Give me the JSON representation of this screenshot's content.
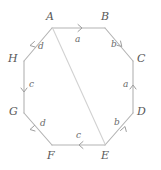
{
  "figure": {
    "name": "labeled-octagon-with-diagonal",
    "shape": "octagon",
    "stroke_color": "#b3b3b3",
    "diagonal_color": "#d0d0d0",
    "label_color": "#585858",
    "edge_label_color": "#6a6a6a",
    "background": "#ffffff"
  },
  "vertices": [
    {
      "id": "A",
      "label": "A",
      "x": 52,
      "y": 28,
      "label_x": 46,
      "label_y": 11
    },
    {
      "id": "B",
      "label": "B",
      "x": 105,
      "y": 28,
      "label_x": 101,
      "label_y": 11
    },
    {
      "id": "C",
      "label": "C",
      "x": 133,
      "y": 61,
      "label_x": 137,
      "label_y": 52
    },
    {
      "id": "D",
      "label": "D",
      "x": 133,
      "y": 113,
      "label_x": 137,
      "label_y": 105
    },
    {
      "id": "E",
      "label": "E",
      "x": 105,
      "y": 145,
      "label_x": 101,
      "label_y": 150
    },
    {
      "id": "F",
      "label": "F",
      "x": 52,
      "y": 145,
      "label_x": 47,
      "label_y": 150
    },
    {
      "id": "G",
      "label": "G",
      "x": 24,
      "y": 113,
      "label_x": 9,
      "label_y": 105
    },
    {
      "id": "H",
      "label": "H",
      "x": 24,
      "y": 61,
      "label_x": 8,
      "label_y": 52
    }
  ],
  "edges": [
    {
      "id": "AB",
      "label": "a",
      "from": "A",
      "to": "B",
      "direction": "A-to-B",
      "arrow_at": 0.55,
      "label_x": 75,
      "label_y": 36
    },
    {
      "id": "BC",
      "label": "b",
      "from": "B",
      "to": "C",
      "direction": "B-to-C",
      "arrow_at": 0.58,
      "label_x": 111,
      "label_y": 43
    },
    {
      "id": "CD",
      "label": "a",
      "from": "D",
      "to": "C",
      "direction": "D-to-C",
      "arrow_at": 0.55,
      "label_x": 122,
      "label_y": 82
    },
    {
      "id": "DE",
      "label": "b",
      "from": "E",
      "to": "D",
      "direction": "E-to-D",
      "arrow_at": 0.55,
      "label_x": 113,
      "label_y": 120
    },
    {
      "id": "EF",
      "label": "c",
      "from": "E",
      "to": "F",
      "direction": "E-to-F",
      "arrow_at": 0.58,
      "label_x": 76,
      "label_y": 132
    },
    {
      "id": "FG",
      "label": "d",
      "from": "F",
      "to": "G",
      "direction": "F-to-G",
      "arrow_at": 0.6,
      "label_x": 41,
      "label_y": 120
    },
    {
      "id": "GH",
      "label": "c",
      "from": "H",
      "to": "G",
      "direction": "H-to-G",
      "arrow_at": 0.55,
      "label_x": 28,
      "label_y": 82
    },
    {
      "id": "HA",
      "label": "d",
      "from": "A",
      "to": "H",
      "direction": "A-to-H",
      "arrow_at": 0.6,
      "label_x": 38,
      "label_y": 44
    }
  ],
  "diagonal": {
    "id": "AE",
    "from": "A",
    "to": "E",
    "label": "",
    "has_arrow": false
  }
}
